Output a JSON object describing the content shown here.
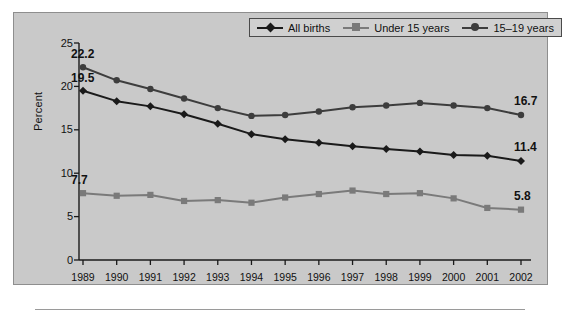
{
  "chart_data": {
    "type": "line",
    "title": "",
    "xlabel": "",
    "ylabel": "Percent",
    "categories": [
      "1989",
      "1990",
      "1991",
      "1992",
      "1993",
      "1994",
      "1995",
      "1996",
      "1997",
      "1998",
      "1999",
      "2000",
      "2001",
      "2002"
    ],
    "ylim": [
      0,
      25
    ],
    "yticks": [
      0,
      5,
      10,
      15,
      20,
      25
    ],
    "ytick_labels": [
      "0",
      "5",
      "10",
      "15",
      "20",
      "25"
    ],
    "grid": false,
    "legend_position": "top-right",
    "series": [
      {
        "name": "All births",
        "color": "#1a1a1a",
        "marker": "diamond",
        "values": [
          19.5,
          18.3,
          17.7,
          16.8,
          15.7,
          14.5,
          13.9,
          13.5,
          13.1,
          12.8,
          12.5,
          12.1,
          12.0,
          11.4
        ],
        "start_label": "19.5",
        "end_label": "11.4"
      },
      {
        "name": "Under 15 years",
        "color": "#7a7a7a",
        "marker": "square",
        "values": [
          7.7,
          7.4,
          7.5,
          6.8,
          6.9,
          6.6,
          7.2,
          7.6,
          8.0,
          7.6,
          7.7,
          7.1,
          6.0,
          5.8
        ],
        "start_label": "7.7",
        "end_label": "5.8"
      },
      {
        "name": "15–19 years",
        "color": "#3d3d3d",
        "marker": "circle",
        "values": [
          22.2,
          20.7,
          19.7,
          18.6,
          17.5,
          16.6,
          16.7,
          17.1,
          17.6,
          17.8,
          18.1,
          17.8,
          17.5,
          16.7
        ],
        "start_label": "22.2",
        "end_label": "16.7"
      }
    ]
  },
  "axis": {
    "y_title": "Percent",
    "y_labels": [
      "25",
      "20",
      "15",
      "10",
      "5",
      "0"
    ],
    "x_labels": [
      "1989",
      "1990",
      "1991",
      "1992",
      "1993",
      "1994",
      "1995",
      "1996",
      "1997",
      "1998",
      "1999",
      "2000",
      "2001",
      "2002"
    ]
  },
  "legend": {
    "items": [
      {
        "label": "All births",
        "color": "#1a1a1a",
        "marker": "diamond"
      },
      {
        "label": "Under 15 years",
        "color": "#7a7a7a",
        "marker": "square"
      },
      {
        "label": "15–19 years",
        "color": "#3d3d3d",
        "marker": "circle"
      }
    ]
  },
  "callouts": {
    "start": [
      "22.2",
      "19.5",
      "7.7"
    ],
    "end": [
      "16.7",
      "11.4",
      "5.8"
    ]
  },
  "colors": {
    "panel_bg": "#c9c9c9",
    "axis": "#1a1a1a",
    "all_births": "#1a1a1a",
    "under_15": "#7a7a7a",
    "age_15_19": "#3d3d3d"
  }
}
